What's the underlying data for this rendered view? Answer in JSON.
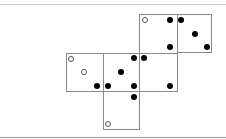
{
  "diagram": {
    "colors": {
      "line": "#8a8a8a",
      "filled_pip": "#000000",
      "open_pip_stroke": "#555555",
      "background": "#ffffff"
    },
    "faces": [
      {
        "id": "top",
        "x": 139,
        "y": 14,
        "w": 39,
        "h": 40
      },
      {
        "id": "top-right",
        "x": 177,
        "y": 14,
        "w": 35,
        "h": 39
      },
      {
        "id": "left",
        "x": 66,
        "y": 53,
        "w": 38,
        "h": 39
      },
      {
        "id": "center",
        "x": 103,
        "y": 53,
        "w": 37,
        "h": 39
      },
      {
        "id": "right",
        "x": 139,
        "y": 53,
        "w": 39,
        "h": 39
      },
      {
        "id": "bottom",
        "x": 103,
        "y": 91,
        "w": 37,
        "h": 39
      }
    ],
    "pips": [
      {
        "x": 145,
        "y": 20,
        "type": "open"
      },
      {
        "x": 170,
        "y": 20,
        "type": "filled"
      },
      {
        "x": 170,
        "y": 47,
        "type": "filled"
      },
      {
        "x": 181,
        "y": 20,
        "type": "filled"
      },
      {
        "x": 195,
        "y": 34,
        "type": "filled"
      },
      {
        "x": 207,
        "y": 47,
        "type": "filled"
      },
      {
        "x": 71,
        "y": 59,
        "type": "open"
      },
      {
        "x": 84,
        "y": 72,
        "type": "open"
      },
      {
        "x": 97,
        "y": 86,
        "type": "filled"
      },
      {
        "x": 108,
        "y": 86,
        "type": "filled"
      },
      {
        "x": 121,
        "y": 72,
        "type": "filled"
      },
      {
        "x": 134,
        "y": 58,
        "type": "filled"
      },
      {
        "x": 134,
        "y": 86,
        "type": "filled"
      },
      {
        "x": 144,
        "y": 58,
        "type": "filled"
      },
      {
        "x": 170,
        "y": 86,
        "type": "filled"
      },
      {
        "x": 134,
        "y": 97,
        "type": "filled"
      },
      {
        "x": 108,
        "y": 124,
        "type": "open"
      }
    ]
  }
}
